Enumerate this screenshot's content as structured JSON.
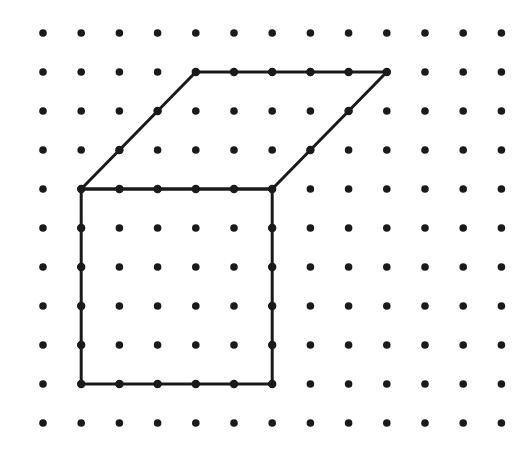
{
  "canvas": {
    "width": 528,
    "height": 451,
    "background": "#ffffff",
    "title": "Dot grid figure"
  },
  "grid": {
    "name": "dot-lattice",
    "columns": 13,
    "rows": 11,
    "origin_x": 43,
    "origin_y": 33,
    "spacing_x": 38.2,
    "spacing_y": 39.0,
    "dot_radius": 3.8,
    "dot_color": "#1a1a1a",
    "total_dots": 143
  },
  "figure": {
    "name": "oblique-box",
    "stroke_color": "#1a1a1a",
    "stroke_width": 3.0,
    "fill": "none",
    "vertex_marker_radius": 4.2,
    "parts": [
      {
        "name": "front-face-rectangle",
        "shape": "rectangle",
        "closed": true,
        "grid_points": [
          [
            1,
            4
          ],
          [
            6,
            4
          ],
          [
            6,
            9
          ],
          [
            1,
            9
          ]
        ],
        "pixel_points": [
          [
            81.2,
            189.0
          ],
          [
            272.2,
            189.0
          ],
          [
            272.2,
            384.0
          ],
          [
            81.2,
            384.0
          ]
        ],
        "width_units": 5,
        "height_units": 5
      },
      {
        "name": "top-face-parallelogram",
        "shape": "parallelogram",
        "closed": true,
        "grid_points": [
          [
            1,
            4
          ],
          [
            4,
            1
          ],
          [
            9,
            1
          ],
          [
            6,
            4
          ]
        ],
        "pixel_points": [
          [
            81.2,
            189.0
          ],
          [
            195.8,
            72.0
          ],
          [
            386.8,
            72.0
          ],
          [
            272.2,
            189.0
          ]
        ],
        "base_units": 5,
        "offset_units": 3
      }
    ],
    "edges": [
      {
        "name": "front-top-edge",
        "from": [
          1,
          4
        ],
        "to": [
          6,
          4
        ],
        "orientation": "horizontal"
      },
      {
        "name": "front-right-edge",
        "from": [
          6,
          4
        ],
        "to": [
          6,
          9
        ],
        "orientation": "vertical"
      },
      {
        "name": "front-bottom-edge",
        "from": [
          1,
          9
        ],
        "to": [
          6,
          9
        ],
        "orientation": "horizontal"
      },
      {
        "name": "front-left-edge",
        "from": [
          1,
          4
        ],
        "to": [
          1,
          9
        ],
        "orientation": "vertical"
      },
      {
        "name": "top-left-diagonal",
        "from": [
          1,
          4
        ],
        "to": [
          4,
          1
        ],
        "orientation": "diagonal-up-right"
      },
      {
        "name": "top-back-edge",
        "from": [
          4,
          1
        ],
        "to": [
          9,
          1
        ],
        "orientation": "horizontal"
      },
      {
        "name": "top-right-diagonal",
        "from": [
          9,
          1
        ],
        "to": [
          6,
          4
        ],
        "orientation": "diagonal-down-left"
      }
    ],
    "on_edge_dots": [
      [
        2,
        4
      ],
      [
        3,
        4
      ],
      [
        4,
        4
      ],
      [
        5,
        4
      ],
      [
        6,
        5
      ],
      [
        6,
        6
      ],
      [
        6,
        7
      ],
      [
        6,
        8
      ],
      [
        2,
        9
      ],
      [
        3,
        9
      ],
      [
        4,
        9
      ],
      [
        5,
        9
      ],
      [
        1,
        5
      ],
      [
        1,
        6
      ],
      [
        1,
        7
      ],
      [
        1,
        8
      ],
      [
        2,
        3
      ],
      [
        3,
        2
      ],
      [
        5,
        1
      ],
      [
        6,
        1
      ],
      [
        7,
        1
      ],
      [
        8,
        1
      ],
      [
        8,
        2
      ],
      [
        7,
        3
      ]
    ]
  }
}
